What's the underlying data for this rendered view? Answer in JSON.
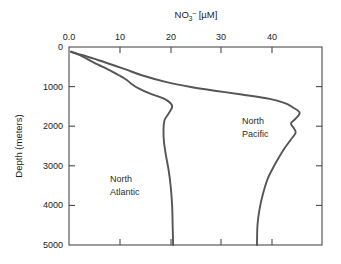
{
  "chart_data": {
    "type": "line",
    "title_parts": {
      "base": "NO",
      "subscript": "3",
      "superscript": "–",
      "units": " [µM]"
    },
    "xlabel": "NO3- [µM]",
    "ylabel": "Depth (meters)",
    "xlim": [
      0,
      49.8
    ],
    "ylim": [
      0,
      5000
    ],
    "y_inverted": true,
    "grid": false,
    "legend": "inline-annotations",
    "xticks": [
      0,
      10,
      20,
      30,
      40
    ],
    "xtick_labels": [
      "0.0",
      "10",
      "20",
      "30",
      "40"
    ],
    "yticks": [
      0,
      1000,
      2000,
      3000,
      4000,
      5000
    ],
    "ytick_labels": [
      "0",
      "1000",
      "2000",
      "3000",
      "4000",
      "5000"
    ],
    "series": [
      {
        "name": "North Atlantic",
        "color": "#555555",
        "annotation_lines": [
          "North",
          "Atlantic"
        ],
        "points": [
          {
            "no3": 0.4,
            "depth": 120
          },
          {
            "no3": 2.0,
            "depth": 200
          },
          {
            "no3": 5.0,
            "depth": 400
          },
          {
            "no3": 8.5,
            "depth": 620
          },
          {
            "no3": 11.0,
            "depth": 800
          },
          {
            "no3": 12.2,
            "depth": 920
          },
          {
            "no3": 13.6,
            "depth": 1040
          },
          {
            "no3": 16.0,
            "depth": 1180
          },
          {
            "no3": 18.6,
            "depth": 1300
          },
          {
            "no3": 20.0,
            "depth": 1420
          },
          {
            "no3": 20.3,
            "depth": 1520
          },
          {
            "no3": 19.6,
            "depth": 1680
          },
          {
            "no3": 18.8,
            "depth": 1850
          },
          {
            "no3": 18.6,
            "depth": 2100
          },
          {
            "no3": 18.7,
            "depth": 2400
          },
          {
            "no3": 19.1,
            "depth": 2750
          },
          {
            "no3": 19.6,
            "depth": 3100
          },
          {
            "no3": 20.0,
            "depth": 3500
          },
          {
            "no3": 20.3,
            "depth": 4000
          },
          {
            "no3": 20.4,
            "depth": 4500
          },
          {
            "no3": 20.5,
            "depth": 5000
          }
        ]
      },
      {
        "name": "North Pacific",
        "color": "#555555",
        "annotation_lines": [
          "North",
          "Pacific"
        ],
        "points": [
          {
            "no3": 0.4,
            "depth": 120
          },
          {
            "no3": 2.5,
            "depth": 200
          },
          {
            "no3": 6.5,
            "depth": 360
          },
          {
            "no3": 11.0,
            "depth": 560
          },
          {
            "no3": 14.5,
            "depth": 720
          },
          {
            "no3": 19.0,
            "depth": 880
          },
          {
            "no3": 24.0,
            "depth": 1010
          },
          {
            "no3": 29.0,
            "depth": 1110
          },
          {
            "no3": 34.0,
            "depth": 1200
          },
          {
            "no3": 39.5,
            "depth": 1310
          },
          {
            "no3": 42.5,
            "depth": 1420
          },
          {
            "no3": 44.0,
            "depth": 1520
          },
          {
            "no3": 45.4,
            "depth": 1660
          },
          {
            "no3": 44.6,
            "depth": 1810
          },
          {
            "no3": 43.7,
            "depth": 1930
          },
          {
            "no3": 44.3,
            "depth": 2060
          },
          {
            "no3": 44.6,
            "depth": 2170
          },
          {
            "no3": 43.6,
            "depth": 2350
          },
          {
            "no3": 42.2,
            "depth": 2600
          },
          {
            "no3": 40.6,
            "depth": 2950
          },
          {
            "no3": 39.2,
            "depth": 3300
          },
          {
            "no3": 38.2,
            "depth": 3700
          },
          {
            "no3": 37.5,
            "depth": 4100
          },
          {
            "no3": 37.1,
            "depth": 4500
          },
          {
            "no3": 37.0,
            "depth": 5000
          }
        ]
      }
    ]
  },
  "colors": {
    "background": "#ffffff",
    "axis": "#4a4a4a",
    "curve": "#555555",
    "text": "#1a1a1a"
  }
}
